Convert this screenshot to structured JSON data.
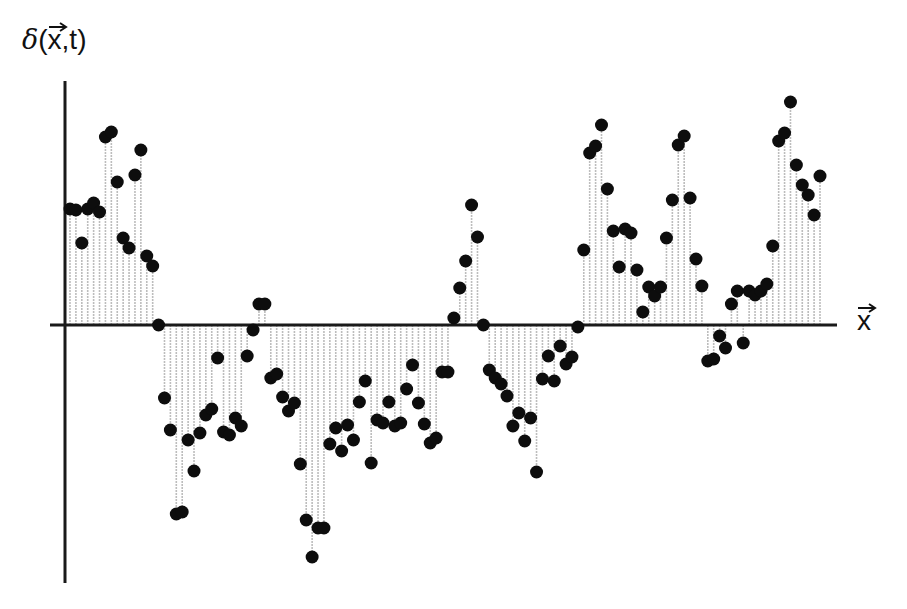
{
  "chart_data": {
    "type": "stem",
    "title": "",
    "ylabel": "δ(x⃗,t)",
    "xlabel": "x⃗",
    "ylabel_parts": {
      "symbol": "δ",
      "open": "(",
      "var": "x",
      "sep": ",t",
      "close": ")"
    },
    "xlabel_parts": {
      "var": "x"
    },
    "grid": false,
    "legend": null,
    "tick_labels": "none",
    "units": "pixels relative to zero line (positive = above axis); no numeric ticks shown",
    "ylim": [
      -235,
      225
    ],
    "x_pixel_range": [
      70,
      820
    ],
    "values": [
      116,
      115,
      82,
      116,
      122,
      113,
      188,
      193,
      143,
      87,
      77,
      150,
      175,
      69,
      59,
      0,
      -73,
      -105,
      -189,
      -187,
      -115,
      -146,
      -108,
      -90,
      -84,
      -33,
      -107,
      -110,
      -93,
      -101,
      -31,
      -5,
      21,
      21,
      -53,
      -49,
      -72,
      -86,
      -78,
      -139,
      -195,
      -232,
      -203,
      -203,
      -119,
      -103,
      -126,
      -100,
      -115,
      -77,
      -56,
      -138,
      -95,
      -98,
      -77,
      -101,
      -98,
      -64,
      -40,
      -78,
      -99,
      -118,
      -113,
      -47,
      -47,
      7,
      37,
      64,
      120,
      88,
      0,
      -45,
      -53,
      -59,
      -71,
      -101,
      -88,
      -116,
      -93,
      -147,
      -54,
      -31,
      -56,
      -21,
      -39,
      -32,
      -2,
      75,
      172,
      179,
      200,
      136,
      94,
      58,
      96,
      92,
      55,
      13,
      38,
      29,
      38,
      87,
      125,
      180,
      189,
      127,
      66,
      39,
      -36,
      -34,
      -11,
      -23,
      21,
      34,
      -18,
      34,
      30,
      34,
      41,
      79,
      184,
      192,
      223,
      160,
      140,
      130,
      110,
      149
    ]
  },
  "style": {
    "axis_color": "#1a1a1a",
    "stem_color": "#bdbdbd",
    "dot_color": "#0d0d0d",
    "background": "#ffffff"
  },
  "layout": {
    "y_axis_x": 65,
    "y_axis_top": 81,
    "y_axis_bottom": 583,
    "x_axis_y": 325,
    "x_axis_left": 50,
    "x_axis_right": 837,
    "first_stem_x": 70,
    "last_stem_x": 820,
    "dot_radius": 6.5
  }
}
